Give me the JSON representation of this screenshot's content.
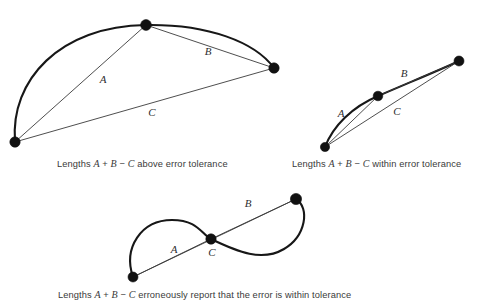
{
  "figure": {
    "background_color": "#ffffff",
    "curve_color": "#171717",
    "chord_color": "#3a3a3a",
    "vertex_color": "#111111",
    "text_color": "#3a3a3a"
  },
  "panels": [
    {
      "id": "panel-above-tolerance",
      "caption_prefix": "Lengths ",
      "caption_a": "A",
      "caption_plus": " + ",
      "caption_b": "B",
      "caption_minus": " − ",
      "caption_c": "C",
      "caption_suffix": " above error tolerance",
      "caption_full": "Lengths A + B − C above error tolerance",
      "labels": {
        "a": "A",
        "b": "B",
        "c": "C"
      },
      "label_positions": {
        "a": {
          "x": 103,
          "y": 80
        },
        "b": {
          "x": 208,
          "y": 52
        },
        "c": {
          "x": 152,
          "y": 113
        }
      },
      "vertices": [
        {
          "name": "start",
          "x": 15,
          "y": 142
        },
        {
          "name": "mid",
          "x": 146,
          "y": 25
        },
        {
          "name": "end",
          "x": 274,
          "y": 68
        }
      ],
      "curve_path": "M15,142 C10,80 60,26 146,25 C208,24 255,42 274,68",
      "chords": [
        {
          "name": "segment-a",
          "from": "start",
          "to": "mid"
        },
        {
          "name": "segment-b",
          "from": "mid",
          "to": "end"
        },
        {
          "name": "segment-c",
          "from": "start",
          "to": "end"
        }
      ]
    },
    {
      "id": "panel-within-tolerance",
      "caption_prefix": "Lengths ",
      "caption_a": "A",
      "caption_plus": " + ",
      "caption_b": "B",
      "caption_minus": " − ",
      "caption_c": "C",
      "caption_suffix": " within error tolerance",
      "caption_full": "Lengths A + B − C within error tolerance",
      "labels": {
        "a": "A",
        "b": "B",
        "c": "C"
      },
      "label_positions": {
        "a": {
          "x": 341,
          "y": 114
        },
        "b": {
          "x": 404,
          "y": 74
        },
        "c": {
          "x": 397,
          "y": 112
        }
      },
      "vertices": [
        {
          "name": "start",
          "x": 325,
          "y": 147
        },
        {
          "name": "mid",
          "x": 378,
          "y": 96
        },
        {
          "name": "end",
          "x": 459,
          "y": 61
        }
      ],
      "curve_path": "M325,147 C333,126 352,107 378,96 C408,83 440,70 459,61",
      "chords": [
        {
          "name": "segment-a",
          "from": "start",
          "to": "mid"
        },
        {
          "name": "segment-b",
          "from": "mid",
          "to": "end"
        },
        {
          "name": "segment-c",
          "from": "start",
          "to": "end"
        }
      ]
    },
    {
      "id": "panel-erroneous-tolerance",
      "caption_prefix": "Lengths ",
      "caption_a": "A",
      "caption_plus": " + ",
      "caption_b": "B",
      "caption_minus": " − ",
      "caption_c": "C",
      "caption_suffix": " erroneously report that the error is within tolerance",
      "caption_full": "Lengths A + B − C erroneously report that the error is within tolerance",
      "labels": {
        "a": "A",
        "b": "B",
        "c": "C"
      },
      "label_positions": {
        "a": {
          "x": 174,
          "y": 250
        },
        "b": {
          "x": 248,
          "y": 204
        },
        "c": {
          "x": 212,
          "y": 253
        }
      },
      "vertices": [
        {
          "name": "start",
          "x": 133,
          "y": 277
        },
        {
          "name": "mid",
          "x": 211,
          "y": 239
        },
        {
          "name": "end",
          "x": 296,
          "y": 199
        }
      ],
      "curve_path": "M133,277 C123,248 141,220 172,220 C198,220 201,234 211,239 C238,252 262,262 284,249 C306,236 310,208 296,199",
      "chords": [
        {
          "name": "segment-a",
          "from": "start",
          "to": "mid"
        },
        {
          "name": "segment-b",
          "from": "mid",
          "to": "end"
        },
        {
          "name": "segment-c",
          "from": "start",
          "to": "end"
        }
      ]
    }
  ]
}
